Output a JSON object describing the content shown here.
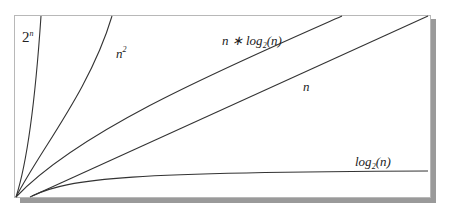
{
  "diagram": {
    "title": "",
    "type": "growth-rate comparison curves",
    "frame": {
      "x": 14,
      "y": 15,
      "width": 416,
      "height": 182,
      "shadow_color": "#9a9a9a",
      "border_color": "#b8b8b8"
    },
    "curves": [
      {
        "id": "exp",
        "label_base": "2",
        "label_sup": "n",
        "label_pos": [
          22,
          28
        ]
      },
      {
        "id": "quad",
        "label_base": "n",
        "label_sup": "2",
        "label_pos": [
          116,
          46
        ]
      },
      {
        "id": "nlogn",
        "label_pre": "n ∗ log",
        "label_sub": "2",
        "label_post": "(n)",
        "label_pos": [
          222,
          38
        ]
      },
      {
        "id": "linear",
        "label_base": "n",
        "label_pos": [
          303,
          80
        ]
      },
      {
        "id": "log",
        "label_pre": "log",
        "label_sub": "2",
        "label_post": "(n)",
        "label_pos": [
          355,
          157
        ]
      }
    ]
  }
}
